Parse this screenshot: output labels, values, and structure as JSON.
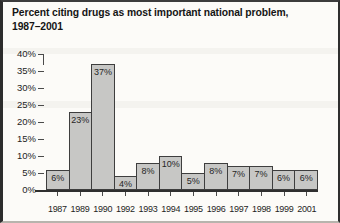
{
  "title": {
    "line1": "Percent citing drugs as most important national problem,",
    "line2": "1987–2001"
  },
  "chart_data": {
    "type": "bar",
    "title": "Percent citing drugs as most important national problem, 1987–2001",
    "categories": [
      "1987",
      "1989",
      "1990",
      "1992",
      "1993",
      "1994",
      "1995",
      "1996",
      "1997",
      "1998",
      "1999",
      "2001"
    ],
    "values": [
      6,
      23,
      37,
      4,
      8,
      10,
      5,
      8,
      7,
      7,
      6,
      6
    ],
    "bar_labels": [
      "6%",
      "23%",
      "37%",
      "4%",
      "8%",
      "10%",
      "5%",
      "8%",
      "7%",
      "7%",
      "6%",
      "6%"
    ],
    "xlabel": "",
    "ylabel": "",
    "ylim": [
      0,
      40
    ],
    "ytick_step": 5,
    "ytick_labels": [
      "0%",
      "5%",
      "10%",
      "15%",
      "20%",
      "25%",
      "30%",
      "35%",
      "40%"
    ],
    "grid": false,
    "legend": "none",
    "bar_fill": "#c7c7c5",
    "bar_border": "#3e3e3e"
  }
}
